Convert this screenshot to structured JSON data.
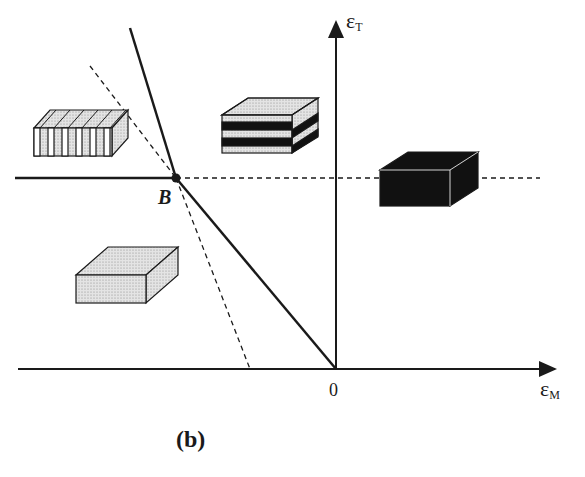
{
  "diagram": {
    "caption": "(b)",
    "axes": {
      "y_label_main": "ε",
      "y_label_sub": "T",
      "x_label_main": "ε",
      "x_label_sub": "M",
      "origin_label": "0"
    },
    "point_label": "B",
    "regions": [
      {
        "name": "vertical-stripes-block",
        "pattern": "vertical stripes (light/dotted alternating)"
      },
      {
        "name": "horizontal-stripes-block",
        "pattern": "horizontal black/dotted stripes"
      },
      {
        "name": "solid-black-block",
        "pattern": "solid black"
      },
      {
        "name": "dotted-grey-block",
        "pattern": "uniform dotted grey"
      }
    ],
    "colors": {
      "ink": "#1a1a1a",
      "dotted_fill": "#d9d9d9",
      "black_fill": "#111111",
      "background": "#ffffff"
    }
  }
}
